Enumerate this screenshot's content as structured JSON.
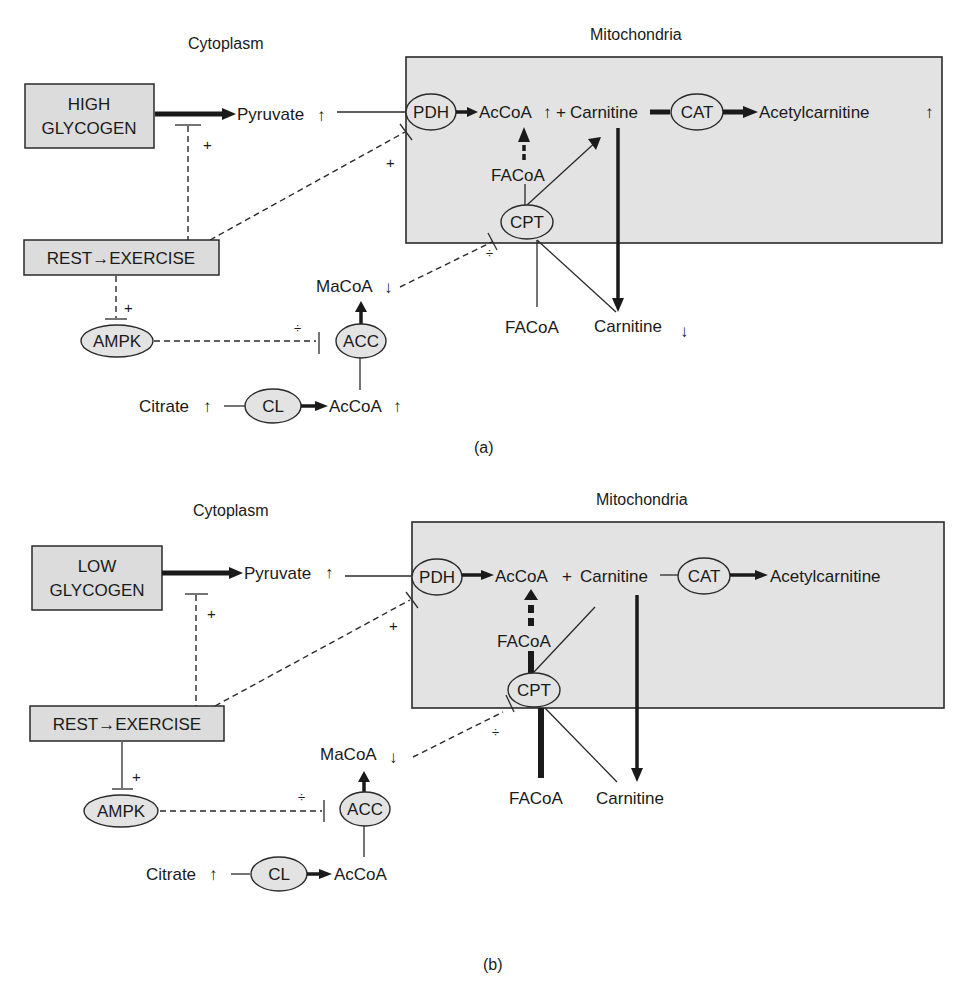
{
  "panels": [
    {
      "id": "a",
      "caption": "(a)",
      "compartments": {
        "cytoplasm": "Cytoplasm",
        "mitochondria": "Mitochondria"
      },
      "glycogen_box": {
        "line1": "HIGH",
        "line2": "GLYCOGEN"
      },
      "exercise_box": "REST→EXERCISE",
      "metabolites": {
        "pyruvate": "Pyruvate",
        "pyruvate_trend": "↑",
        "acCoA_mito": "AcCoA",
        "acCoA_mito_trend": "↑",
        "plus_join": "+",
        "carnitine_mito": "Carnitine",
        "acetylcarnitine": "Acetylcarnitine",
        "acetylcarnitine_trend": "↑",
        "facoa_mito": "FACoA",
        "facoa_cyto": "FACoA",
        "carnitine_cyto": "Carnitine",
        "carnitine_cyto_trend": "↓",
        "macoa": "MaCoA",
        "macoa_trend": "↓",
        "citrate": "Citrate",
        "citrate_trend": "↑",
        "acCoA_cyto": "AcCoA",
        "acCoA_cyto_trend": "↑"
      },
      "enzymes": {
        "pdh": "PDH",
        "cat": "CAT",
        "cpt": "CPT",
        "ampk": "AMPK",
        "acc": "ACC",
        "cl": "CL"
      },
      "signs": {
        "glycogen_inhib": "+",
        "pdh_act": "+",
        "ampk_act": "+",
        "acc_inhib": "÷",
        "cpt_inhib": "÷"
      }
    },
    {
      "id": "b",
      "caption": "(b)",
      "compartments": {
        "cytoplasm": "Cytoplasm",
        "mitochondria": "Mitochondria"
      },
      "glycogen_box": {
        "line1": "LOW",
        "line2": "GLYCOGEN"
      },
      "exercise_box": "REST→EXERCISE",
      "metabolites": {
        "pyruvate": "Pyruvate",
        "pyruvate_trend": "↑",
        "acCoA_mito": "AcCoA",
        "plus_join": "+",
        "carnitine_mito": "Carnitine",
        "acetylcarnitine": "Acetylcarnitine",
        "facoa_mito": "FACoA",
        "facoa_cyto": "FACoA",
        "carnitine_cyto": "Carnitine",
        "macoa": "MaCoA",
        "macoa_trend": "↓",
        "citrate": "Citrate",
        "citrate_trend": "↑",
        "acCoA_cyto": "AcCoA"
      },
      "enzymes": {
        "pdh": "PDH",
        "cat": "CAT",
        "cpt": "CPT",
        "ampk": "AMPK",
        "acc": "ACC",
        "cl": "CL"
      },
      "signs": {
        "glycogen_inhib": "+",
        "pdh_act": "+",
        "ampk_act": "+",
        "acc_inhib": "÷",
        "cpt_inhib": "÷"
      }
    }
  ],
  "colors": {
    "box_fill": "#dcdcdc",
    "mito_fill": "#e3e3e3",
    "ink": "#1a1a1a"
  }
}
